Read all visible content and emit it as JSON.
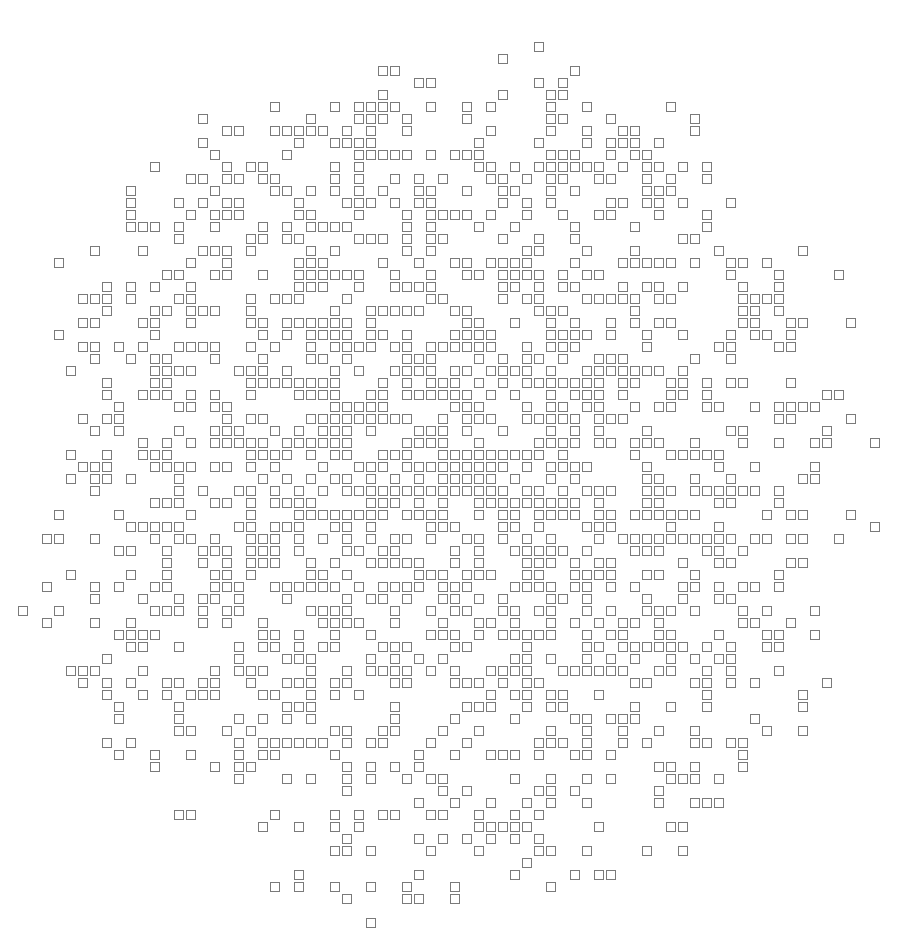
{
  "artwork": {
    "title": "Square Scatter Pattern",
    "type": "generative-pattern",
    "canvas": {
      "width": 900,
      "height": 943,
      "background_color": "#ffffff"
    },
    "glyph": {
      "shape": "square",
      "size_px": 9,
      "stroke_color": "#7a7a7a",
      "stroke_width_px": 1,
      "fill": "none"
    },
    "grid": {
      "pitch_px": 12,
      "origin_x": 6,
      "origin_y": 6,
      "columns": 74,
      "rows": 78
    },
    "distribution": {
      "envelope_shape": "disc",
      "center_x": 447,
      "center_y": 480,
      "radius_x": 430,
      "radius_y": 445,
      "density_center": 0.62,
      "density_edge": 0.02,
      "falloff": "smooth-radial",
      "clustering": "fractal-self-similar",
      "seed": 20240617
    },
    "structure": {
      "motif": "sierpinski-like clusters of 4-5 squares forming plus and diagonal arrangements",
      "symmetry": "none (quasi-random)",
      "approx_square_count": 980
    }
  }
}
